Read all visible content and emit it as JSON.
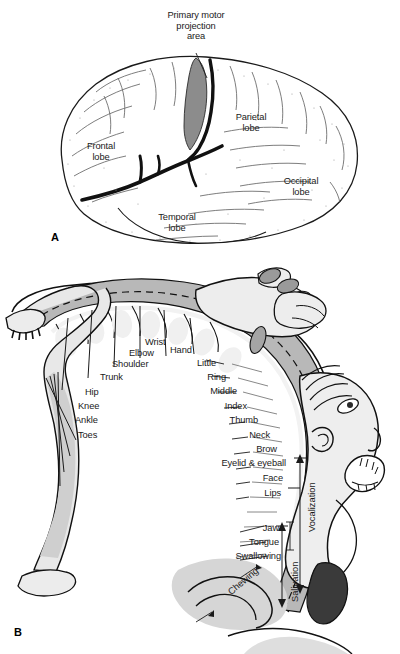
{
  "figure": {
    "title_a_callout": [
      "Primary motor",
      "projection",
      "area"
    ],
    "panel_a_letter": "A",
    "panel_b_letter": "B"
  },
  "panel_a": {
    "letter": "A",
    "callout": {
      "line1": "Primary motor",
      "line2": "projection",
      "line3": "area"
    },
    "lobes": [
      {
        "name": "frontal-lobe",
        "line1": "Frontal",
        "line2": "lobe"
      },
      {
        "name": "parietal-lobe",
        "line1": "Parietal",
        "line2": "lobe"
      },
      {
        "name": "occipital-lobe",
        "line1": "Occipital",
        "line2": "lobe"
      },
      {
        "name": "temporal-lobe",
        "line1": "Temporal",
        "line2": "lobe"
      }
    ]
  },
  "panel_b": {
    "letter": "B",
    "medial_labels": [
      {
        "name": "toes",
        "text": "Toes"
      },
      {
        "name": "ankle",
        "text": "Ankle"
      },
      {
        "name": "knee",
        "text": "Knee"
      },
      {
        "name": "hip",
        "text": "Hip"
      },
      {
        "name": "trunk",
        "text": "Trunk"
      },
      {
        "name": "shoulder",
        "text": "Shoulder"
      },
      {
        "name": "elbow",
        "text": "Elbow"
      },
      {
        "name": "wrist",
        "text": "Wrist"
      },
      {
        "name": "hand",
        "text": "Hand"
      }
    ],
    "lateral_labels": [
      {
        "name": "little",
        "text": "Little"
      },
      {
        "name": "ring",
        "text": "Ring"
      },
      {
        "name": "middle",
        "text": "Middle"
      },
      {
        "name": "index",
        "text": "Index"
      },
      {
        "name": "thumb",
        "text": "Thumb"
      },
      {
        "name": "neck",
        "text": "Neck"
      },
      {
        "name": "brow",
        "text": "Brow"
      },
      {
        "name": "eyelid-eyeball",
        "text": "Eyelid & eyeball"
      },
      {
        "name": "face",
        "text": "Face"
      },
      {
        "name": "lips",
        "text": "Lips"
      },
      {
        "name": "jaw",
        "text": "Jaw"
      },
      {
        "name": "tongue",
        "text": "Tongue"
      },
      {
        "name": "swallowing",
        "text": "Swallowing"
      }
    ],
    "rotated_labels": [
      {
        "name": "vocalization",
        "text": "Vocalization"
      },
      {
        "name": "salivation",
        "text": "Salivation"
      },
      {
        "name": "chewing",
        "text": "Chewing"
      }
    ]
  },
  "colors": {
    "ink": "#1a1a1a",
    "outline": "#000000",
    "motor_area_gray": "#8c8c8c",
    "cortex_band_gray": "#b8b8b8",
    "body_light_gray": "#e8e8e8",
    "body_mid_gray": "#cfcfcf",
    "dark_shape": "#3a3a3a",
    "background": "#ffffff"
  }
}
